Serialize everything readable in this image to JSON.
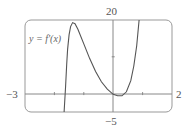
{
  "chart_data": {
    "type": "line",
    "title": "",
    "function_label": "y = f'(x)",
    "xlim": [
      -3,
      2
    ],
    "ylim": [
      -5,
      20
    ],
    "x_tick_labels": {
      "left": "−3",
      "right": "2"
    },
    "y_tick_labels": {
      "top": "20",
      "bottom": "−5"
    },
    "x_ticks": [
      -2,
      -1,
      1
    ],
    "y_ticks": [
      10
    ],
    "grid": false,
    "series": [
      {
        "name": "f'(x)",
        "points": [
          [
            -1.67,
            -5
          ],
          [
            -1.62,
            2
          ],
          [
            -1.58,
            8
          ],
          [
            -1.55,
            12
          ],
          [
            -1.5,
            16
          ],
          [
            -1.45,
            18.2
          ],
          [
            -1.38,
            19.3
          ],
          [
            -1.3,
            19
          ],
          [
            -1.2,
            17.5
          ],
          [
            -1.0,
            13.5
          ],
          [
            -0.8,
            9.5
          ],
          [
            -0.6,
            6
          ],
          [
            -0.4,
            3.2
          ],
          [
            -0.2,
            1.2
          ],
          [
            0.0,
            -0.2
          ],
          [
            0.15,
            -0.6
          ],
          [
            0.3,
            -0.6
          ],
          [
            0.45,
            0.5
          ],
          [
            0.6,
            3.5
          ],
          [
            0.7,
            7.5
          ],
          [
            0.8,
            13
          ],
          [
            0.88,
            20
          ]
        ]
      }
    ]
  }
}
